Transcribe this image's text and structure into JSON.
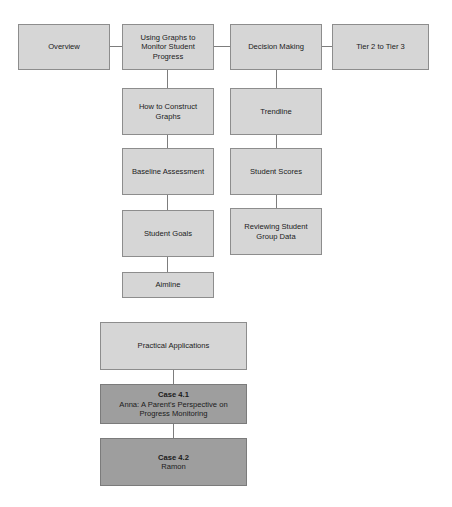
{
  "diagram": {
    "colors": {
      "light_box_fill": "#d6d6d6",
      "dark_box_fill": "#9e9e9e",
      "box_border": "#8d8d8d",
      "connector": "#7d7d7d",
      "text": "#1b1b1b",
      "background": "#ffffff"
    },
    "nodes": {
      "overview": {
        "label": "Overview"
      },
      "using_graphs": {
        "label": "Using Graphs to Monitor Student Progress"
      },
      "decision_making": {
        "label": "Decision Making"
      },
      "tier2_to_tier3": {
        "label": "Tier 2 to Tier 3"
      },
      "how_to_construct_graphs": {
        "label": "How to Construct Graphs"
      },
      "baseline_assessment": {
        "label": "Baseline Assessment"
      },
      "student_goals": {
        "label": "Student Goals"
      },
      "aimline": {
        "label": "Aimline"
      },
      "trendline": {
        "label": "Trendline"
      },
      "student_scores": {
        "label": "Student Scores"
      },
      "reviewing_student_group_data": {
        "label": "Reviewing Student Group Data"
      },
      "practical_applications": {
        "label": "Practical Applications"
      },
      "case_4_1": {
        "heading": "Case 4.1",
        "label": "Anna: A Parent's Perspective on Progress Monitoring"
      },
      "case_4_2": {
        "heading": "Case 4.2",
        "label": "Ramon"
      }
    }
  }
}
